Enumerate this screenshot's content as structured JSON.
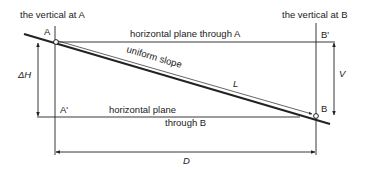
{
  "diagram": {
    "labels": {
      "vertical_a": "the vertical at A",
      "vertical_b": "the vertical at B",
      "point_a": "A",
      "point_a_prime": "A'",
      "point_b": "B",
      "point_b_prime": "B'",
      "plane_a": "horizontal plane through A",
      "plane_b_line1": "horizontal plane",
      "plane_b_line2": "through B",
      "slope": "uniform slope",
      "slope_length": "L",
      "delta_h": "ΔH",
      "vertical_distance": "V",
      "horizontal_distance": "D"
    },
    "colors": {
      "line": "#222222",
      "background": "#ffffff"
    }
  }
}
